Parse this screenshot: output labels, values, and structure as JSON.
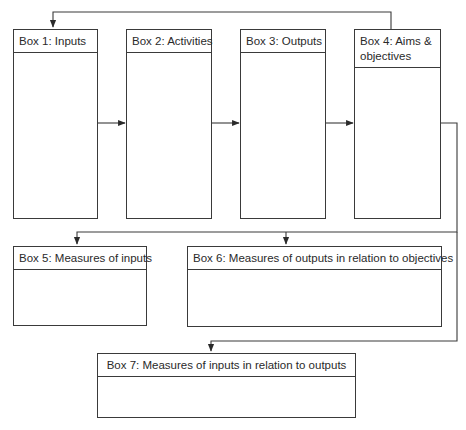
{
  "diagram": {
    "boxes": [
      {
        "id": "box1",
        "label": "Box 1:  Inputs"
      },
      {
        "id": "box2",
        "label": "Box 2:  Activities"
      },
      {
        "id": "box3",
        "label": "Box 3:  Outputs"
      },
      {
        "id": "box4",
        "label_line1": "Box 4:  Aims &",
        "label_line2": "objectives"
      },
      {
        "id": "box5",
        "label": "Box 5:  Measures of inputs"
      },
      {
        "id": "box6",
        "label": "Box 6:  Measures of outputs in relation to objectives"
      },
      {
        "id": "box7",
        "label": "Box 7:  Measures of inputs in relation to outputs"
      }
    ],
    "connections": [
      {
        "from": "box1",
        "to": "box2"
      },
      {
        "from": "box2",
        "to": "box3"
      },
      {
        "from": "box3",
        "to": "box4"
      },
      {
        "from": "box4",
        "to": "box1",
        "note": "feedback loop over top"
      },
      {
        "from": "box4",
        "to": "box5"
      },
      {
        "from": "box4",
        "to": "box6"
      },
      {
        "from": "box4",
        "to": "box7"
      }
    ],
    "colors": {
      "line": "#3a3a3a",
      "background": "#ffffff"
    }
  }
}
